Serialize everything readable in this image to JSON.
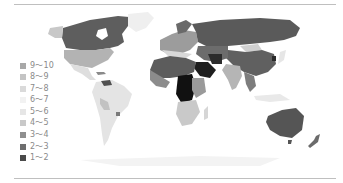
{
  "map": {
    "type": "choropleth-world-map",
    "projection": "equirectangular",
    "colors": {
      "background": "#ffffff",
      "rule": "#bfbfbf",
      "ocean": "#ffffff"
    }
  },
  "legend": {
    "items": [
      {
        "label": "9～10",
        "color": "#a8a8a8"
      },
      {
        "label": "8～9",
        "color": "#c4c4c4"
      },
      {
        "label": "7～8",
        "color": "#dadada"
      },
      {
        "label": "6～7",
        "color": "#f2f2f2"
      },
      {
        "label": "5～6",
        "color": "#e6e6e6"
      },
      {
        "label": "4～5",
        "color": "#c9c9c9"
      },
      {
        "label": "3～4",
        "color": "#8f8f8f"
      },
      {
        "label": "2～3",
        "color": "#6e6e6e"
      },
      {
        "label": "1～2",
        "color": "#4a4a4a"
      }
    ]
  }
}
